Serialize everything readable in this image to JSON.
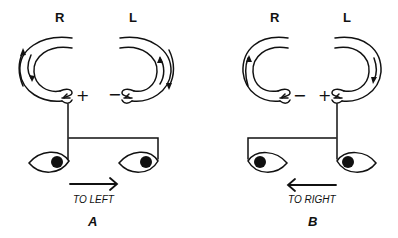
{
  "diagram": {
    "type": "vestibulo-ocular reflex schematic",
    "panels": [
      {
        "id": "A",
        "caption": "A",
        "canals": [
          {
            "side_label": "R",
            "sign": "+",
            "flow_arrows": "outer up / inner down (ampullopetal)"
          },
          {
            "side_label": "L",
            "sign": "−",
            "flow_arrows": "inner up / outer down"
          }
        ],
        "eye_movement_label": "TO LEFT",
        "arrow_direction": "right"
      },
      {
        "id": "B",
        "caption": "B",
        "canals": [
          {
            "side_label": "R",
            "sign": "−",
            "flow_arrows": "inner up"
          },
          {
            "side_label": "L",
            "sign": "+",
            "flow_arrows": "inner down"
          }
        ],
        "eye_movement_label": "TO RIGHT",
        "arrow_direction": "left"
      }
    ]
  },
  "colors": {
    "ink": "#111111",
    "background": "#ffffff"
  }
}
